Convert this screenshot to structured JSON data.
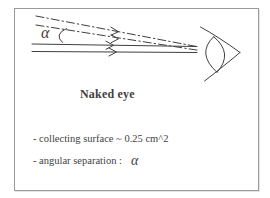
{
  "diagram": {
    "angle_label": "α",
    "caption": "Naked eye"
  },
  "notes": {
    "line1": "- collecting surface ~ 0.25 cm^2",
    "line2_label": "- angular separation :",
    "line2_symbol": "α"
  },
  "icons": {
    "eye": "eye-icon",
    "ray_arrows": "arrowhead-chevron"
  },
  "colors": {
    "ink": "#3f3f3f",
    "frame_border": "#9a9a9a",
    "paper": "#ffffff"
  }
}
